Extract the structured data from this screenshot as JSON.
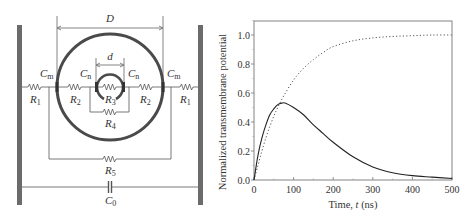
{
  "circuit": {
    "dimension_outer": "D",
    "dimension_inner": "d",
    "labels": {
      "Cm_left": {
        "main": "C",
        "sub": "m"
      },
      "Cm_right": {
        "main": "C",
        "sub": "m"
      },
      "Cn_left": {
        "main": "C",
        "sub": "n"
      },
      "Cn_right": {
        "main": "C",
        "sub": "n"
      },
      "R1_left": {
        "main": "R",
        "sub": "1"
      },
      "R1_right": {
        "main": "R",
        "sub": "1"
      },
      "R2_left": {
        "main": "R",
        "sub": "2"
      },
      "R2_right": {
        "main": "R",
        "sub": "2"
      },
      "R3": {
        "main": "R",
        "sub": "3"
      },
      "R4": {
        "main": "R",
        "sub": "4"
      },
      "R5": {
        "main": "R",
        "sub": "5"
      },
      "C0": {
        "main": "C",
        "sub": "0"
      }
    },
    "colors": {
      "electrode": "#6b6b6b",
      "membrane": "#4a4a4a",
      "wire": "#555555"
    }
  },
  "chart_data": {
    "type": "line",
    "title": "",
    "xlabel": "Time, t (ns)",
    "ylabel": "Normalized transmembrane potential",
    "xlim": [
      0,
      500
    ],
    "ylim": [
      0,
      1.1
    ],
    "xticks": [
      0,
      100,
      200,
      300,
      400,
      500
    ],
    "xtick_labels": [
      "0",
      "100",
      "200",
      "300",
      "400",
      "500"
    ],
    "yticks": [
      0.0,
      0.2,
      0.4,
      0.6,
      0.8,
      1.0
    ],
    "ytick_labels": [
      "0.0",
      "0.2",
      "0.4",
      "0.6",
      "0.8",
      "1.0"
    ],
    "grid": false,
    "legend": null,
    "series": [
      {
        "name": "solid",
        "style": "solid",
        "x": [
          0,
          10,
          20,
          30,
          40,
          50,
          60,
          70,
          80,
          100,
          125,
          150,
          175,
          200,
          250,
          300,
          350,
          400,
          450,
          500
        ],
        "y": [
          0.0,
          0.17,
          0.29,
          0.38,
          0.45,
          0.49,
          0.52,
          0.53,
          0.53,
          0.5,
          0.45,
          0.38,
          0.32,
          0.26,
          0.16,
          0.09,
          0.05,
          0.03,
          0.02,
          0.01
        ]
      },
      {
        "name": "dotted",
        "style": "dotted",
        "x": [
          0,
          10,
          20,
          30,
          40,
          50,
          60,
          75,
          100,
          125,
          150,
          175,
          200,
          250,
          300,
          350,
          400,
          450,
          500
        ],
        "y": [
          0.0,
          0.1,
          0.2,
          0.29,
          0.37,
          0.44,
          0.5,
          0.58,
          0.69,
          0.77,
          0.83,
          0.88,
          0.92,
          0.96,
          0.98,
          0.99,
          0.995,
          1.0,
          1.0
        ]
      }
    ]
  }
}
